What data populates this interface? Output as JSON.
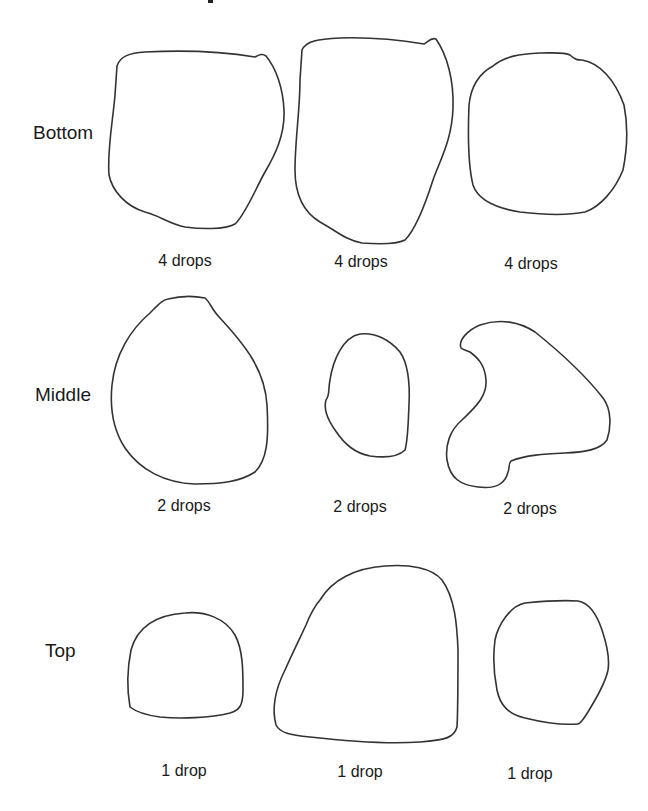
{
  "rows": [
    {
      "label": "Bottom",
      "samples": [
        {
          "label": "4 drops"
        },
        {
          "label": "4 drops"
        },
        {
          "label": "4 drops"
        }
      ]
    },
    {
      "label": "Middle",
      "samples": [
        {
          "label": "2 drops"
        },
        {
          "label": "2 drops"
        },
        {
          "label": "2 drops"
        }
      ]
    },
    {
      "label": "Top",
      "samples": [
        {
          "label": "1 drop"
        },
        {
          "label": "1 drop"
        },
        {
          "label": "1 drop"
        }
      ]
    }
  ],
  "style": {
    "outline_color": "#333333",
    "text_color": "#1a1a1a",
    "background": "#ffffff"
  }
}
